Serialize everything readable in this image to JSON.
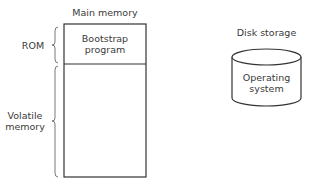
{
  "diagram": {
    "main_memory": {
      "title": "Main memory",
      "rom_section": {
        "line1": "Bootstrap",
        "line2": "program"
      },
      "side_labels": {
        "rom": "ROM",
        "volatile_line1": "Volatile",
        "volatile_line2": "memory"
      }
    },
    "disk": {
      "title": "Disk storage",
      "content": {
        "line1": "Operating",
        "line2": "system"
      }
    }
  }
}
